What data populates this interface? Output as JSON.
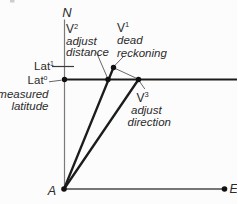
{
  "diagram": {
    "axes": {
      "north": "N",
      "east": "E",
      "origin": "A"
    },
    "vectors": {
      "v1": {
        "symbol": "V",
        "sup": "1",
        "caption": [
          "dead",
          "reckoning"
        ]
      },
      "v2": {
        "symbol": "V",
        "sup": "2",
        "caption": [
          "adjust",
          "distance"
        ]
      },
      "v3": {
        "symbol": "V",
        "sup": "3",
        "caption": [
          "adjust",
          "direction"
        ]
      }
    },
    "latitudes": {
      "lat1": {
        "symbol": "Lat",
        "sup": "1"
      },
      "lat0": {
        "symbol": "Lat",
        "sup": "o",
        "caption": [
          "measured",
          "latitude"
        ]
      }
    },
    "colors": {
      "background": "#fcfcfc",
      "axis_line": "#7a7a7a",
      "main_line": "#1c1c1c",
      "leader_line": "#555555",
      "text": "#2b2b2b"
    }
  }
}
